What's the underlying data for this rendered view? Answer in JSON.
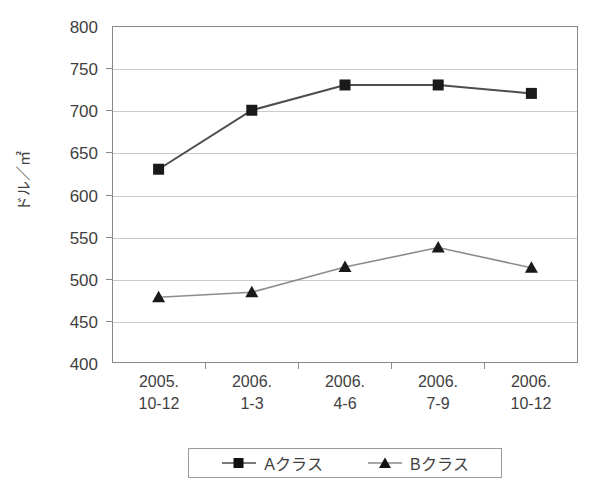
{
  "chart_data": {
    "type": "line",
    "title": "",
    "xlabel": "",
    "ylabel": "ドル／㎡",
    "ylim": [
      400,
      800
    ],
    "ytick_step": 50,
    "yticks": [
      800,
      750,
      700,
      650,
      600,
      550,
      500,
      450,
      400
    ],
    "grid": true,
    "legend_position": "bottom",
    "categories": [
      {
        "line1": "2005.",
        "line2": "10-12"
      },
      {
        "line1": "2006.",
        "line2": "1-3"
      },
      {
        "line1": "2006.",
        "line2": "4-6"
      },
      {
        "line1": "2006.",
        "line2": "7-9"
      },
      {
        "line1": "2006.",
        "line2": "10-12"
      }
    ],
    "series": [
      {
        "name": "Aクラス",
        "marker": "square",
        "color": "#1a1a1a",
        "values": [
          630,
          700,
          730,
          730,
          720
        ]
      },
      {
        "name": "Bクラス",
        "marker": "triangle",
        "color": "#1a1a1a",
        "values": [
          478,
          484,
          514,
          537,
          513
        ]
      }
    ]
  },
  "legend": {
    "entries": [
      {
        "label": "Aクラス",
        "marker": "square-marker-icon"
      },
      {
        "label": "Bクラス",
        "marker": "triangle-marker-icon"
      }
    ]
  },
  "colors": {
    "line": "#5a5a5a",
    "marker": "#111111",
    "gridline": "#c9c9c9",
    "axis": "#888888",
    "text": "#3f3f3f",
    "background": "#ffffff"
  }
}
